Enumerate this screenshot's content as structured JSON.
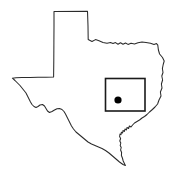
{
  "figure": {
    "background_color": "#ffffff",
    "width": 176,
    "height": 176
  },
  "map": {
    "region_name": "Texas",
    "outline_color": "#2b2b2b",
    "outline_width": 1.05,
    "fill_color": "#ffffff",
    "outline_path": "M 54.0 11.5 L 87.5 11.2 L 88.0 26.0 L 88.2 39.5 L 92.0 41.5 L 95.5 39.6 L 99.0 40.8 L 103.0 42.4 L 107.0 43.2 L 110.5 42.6 L 113.0 43.6 L 115.5 42.6 L 118.0 44.2 L 120.5 42.7 L 123.0 44.3 L 125.5 43.0 L 128.0 44.4 L 131.0 43.2 L 134.5 44.0 L 138.0 42.8 L 142.0 42.0 L 146.0 42.6 L 150.5 43.2 L 154.0 44.6 L 156.5 43.6 L 157.8 45.2 L 158.4 50.0 L 159.6 54.0 L 162.5 57.5 L 164.2 61.0 L 163.2 64.5 L 162.4 68.5 L 163.0 72.5 L 161.8 76.0 L 162.6 80.0 L 161.4 84.0 L 162.0 88.0 L 160.4 92.0 L 161.0 96.0 L 159.0 100.0 L 157.6 104.0 L 155.0 107.0 L 152.4 109.5 L 149.5 112.0 L 147.0 114.5 L 144.5 116.5 L 142.0 118.0 L 139.5 120.0 L 137.0 121.5 L 134.5 123.0 L 132.6 125.0 L 131.0 127.0 L 129.4 126.0 L 128.6 128.5 L 127.0 127.5 L 126.4 130.0 L 125.0 129.0 L 124.4 131.5 L 123.0 130.5 L 122.6 133.0 L 121.4 132.2 L 121.0 134.6 L 120.0 134.0 L 119.6 136.5 L 120.6 138.5 L 119.8 141.0 L 120.8 143.0 L 120.2 145.5 L 121.2 147.5 L 120.6 150.0 L 121.6 152.5 L 121.4 155.5 L 122.4 158.0 L 123.2 161.0 L 124.4 163.5 L 125.4 165.5 L 123.0 164.5 L 119.5 162.0 L 116.0 159.0 L 112.5 156.0 L 109.0 153.0 L 105.5 150.5 L 102.0 148.5 L 98.5 147.0 L 95.0 145.5 L 91.5 144.0 L 88.0 142.0 L 85.0 139.5 L 82.0 137.0 L 79.0 134.5 L 76.0 132.0 L 73.5 129.0 L 71.5 126.0 L 70.0 123.0 L 68.5 120.0 L 67.0 117.0 L 65.5 114.0 L 64.0 111.5 L 62.0 109.5 L 59.5 108.5 L 57.0 108.8 L 54.5 110.0 L 52.0 111.5 L 49.5 112.5 L 47.5 111.0 L 46.0 108.5 L 44.5 106.0 L 42.5 104.5 L 40.0 105.0 L 38.0 106.5 L 36.0 107.5 L 34.0 106.5 L 32.0 104.5 L 30.5 102.0 L 29.0 99.0 L 27.5 96.0 L 26.0 93.0 L 24.0 90.5 L 22.0 88.0 L 20.0 85.5 L 17.5 83.0 L 15.0 80.5 L 12.4 78.2 L 16.0 77.8 L 22.0 77.6 L 30.0 77.4 L 38.0 77.3 L 46.0 77.2 L 53.6 77.1 L 53.8 60.0 L 53.9 42.0 L 54.0 26.0 Z",
    "highlight_box": {
      "label": "county-highlight-box",
      "x": 105.5,
      "y": 78.5,
      "width": 39.5,
      "height": 32.5,
      "stroke_color": "#1a1a1a",
      "stroke_width": 1.6
    },
    "location_marker": {
      "label": "city-location-dot",
      "cx": 118.0,
      "cy": 100.0,
      "r": 3.6,
      "color": "#000000"
    }
  }
}
